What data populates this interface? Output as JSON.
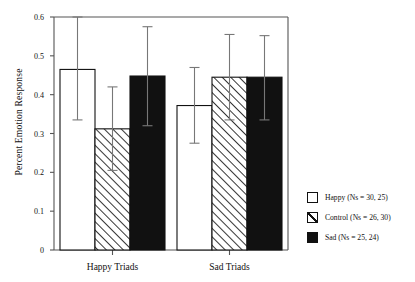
{
  "chart_data": {
    "type": "bar",
    "title": "",
    "xlabel": "",
    "ylabel": "Percent Emotion Response",
    "ylim": [
      0,
      0.6
    ],
    "yticks": [
      "0",
      "0.1",
      "0.2",
      "0.3",
      "0.4",
      "0.5",
      "0.6"
    ],
    "ytick_values": [
      0,
      0.1,
      0.2,
      0.3,
      0.4,
      0.5,
      0.6
    ],
    "grid": false,
    "legend_position": "right",
    "categories": [
      "Happy Triads",
      "Sad Triads"
    ],
    "series": [
      {
        "name": "Happy (Ns = 30, 25)",
        "fill": "open",
        "values": [
          0.465,
          0.372
        ],
        "err_upper": [
          0.6,
          0.47
        ],
        "err_lower": [
          0.335,
          0.275
        ]
      },
      {
        "name": "Control (Ns = 26, 30)",
        "fill": "hatched",
        "values": [
          0.312,
          0.445
        ],
        "err_upper": [
          0.42,
          0.555
        ],
        "err_lower": [
          0.205,
          0.335
        ]
      },
      {
        "name": "Sad (Ns = 25, 24)",
        "fill": "solid",
        "values": [
          0.448,
          0.445
        ],
        "err_upper": [
          0.575,
          0.552
        ],
        "err_lower": [
          0.32,
          0.335
        ]
      }
    ]
  },
  "axis": {
    "y_title": "Percent Emotion Response"
  },
  "legend": {
    "items": [
      {
        "label": "Happy (Ns = 30, 25)",
        "swatch": "open-square-icon"
      },
      {
        "label": "Control (Ns = 26, 30)",
        "swatch": "hatched-square-icon"
      },
      {
        "label": "Sad (Ns = 25, 24)",
        "swatch": "filled-square-icon"
      }
    ]
  },
  "colors": {
    "axis": "#555555",
    "ink": "#111111",
    "bar_open": "#ffffff",
    "bar_solid": "#111111",
    "background": "#ffffff"
  }
}
